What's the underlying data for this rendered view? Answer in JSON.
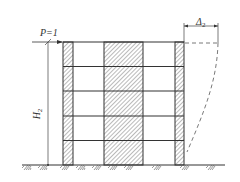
{
  "diagram": {
    "type": "structural frame-shear wall lateral deflection diagram",
    "labels": {
      "load": {
        "symbol": "P",
        "eq": "=1"
      },
      "displacement": {
        "symbol": "Δ",
        "subscript": "2"
      },
      "height": {
        "symbol": "H",
        "subscript": "2"
      }
    },
    "frame": {
      "stories": 5,
      "columns": [
        {
          "name": "left-wall",
          "hatched": true
        },
        {
          "name": "middle-wall",
          "hatched": true
        },
        {
          "name": "right-wall",
          "hatched": true
        }
      ],
      "bays": 2
    },
    "colors": {
      "line": "#333333",
      "hatch": "#555555",
      "background": "#ffffff"
    }
  }
}
